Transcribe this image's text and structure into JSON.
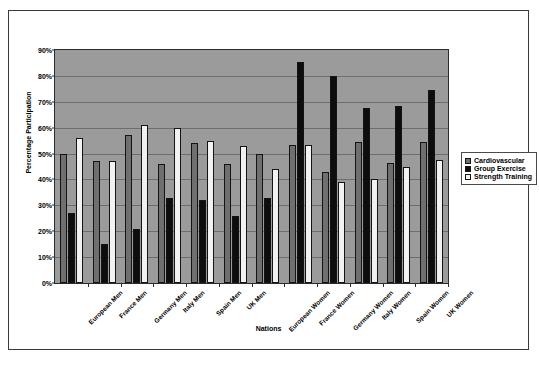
{
  "chart_data": {
    "type": "bar",
    "title": "",
    "xlabel": "Nations",
    "ylabel": "Percentage Participation",
    "ylim": [
      0,
      90
    ],
    "ytick_labels": [
      "0%",
      "10%",
      "20%",
      "30%",
      "40%",
      "50%",
      "60%",
      "70%",
      "80%",
      "90%"
    ],
    "ytick_values": [
      0,
      10,
      20,
      30,
      40,
      50,
      60,
      70,
      80,
      90
    ],
    "grid": true,
    "legend_position": "right",
    "categories": [
      "European Men",
      "France Men",
      "Germany Men",
      "Italy Men",
      "Spain Men",
      "UK Men",
      "European Women",
      "France Women",
      "Germany Women",
      "Italy Women",
      "Spain Women",
      "UK Women"
    ],
    "series": [
      {
        "name": "Cardiovascular",
        "color": "#6f6f6f",
        "values": [
          50,
          47,
          57,
          46,
          54,
          46,
          50,
          53.5,
          43,
          54.5,
          46.5,
          54.5
        ]
      },
      {
        "name": "Group Exercise",
        "color": "#0d0d0d",
        "values": [
          27,
          15,
          21,
          33,
          32,
          26,
          33,
          85.5,
          80,
          67.5,
          68.5,
          74.5
        ]
      },
      {
        "name": "Strength Training",
        "color": "#f2f2f2",
        "values": [
          56,
          47,
          61,
          60,
          55,
          53,
          44,
          53.5,
          39,
          40,
          45,
          47.5
        ]
      }
    ],
    "plot_background": "#9b9b9b",
    "page_background": "#ffffff"
  }
}
